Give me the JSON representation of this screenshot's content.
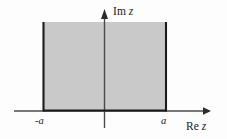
{
  "figure": {
    "background_color": "#fdfdfd",
    "region_fill_color": "#c9c9c9",
    "region_border_color": "#1a1a1a",
    "axis_color": "#4a4a4a",
    "text_color": "#1a1a1a",
    "axes": {
      "vertical": {
        "label_prefix": "Im",
        "label_variable": "z",
        "label_full": "Im z",
        "x_position": 104,
        "arrow_tip_y": 10,
        "base_y": 128
      },
      "horizontal": {
        "label_prefix": "Re",
        "label_variable": "z",
        "label_full": "Re z",
        "y_position": 111,
        "arrow_tip_x": 210,
        "start_x": 14
      }
    },
    "ticks": [
      {
        "name": "negative-a",
        "label_sign": "-",
        "label_variable": "a",
        "label_full": "-a",
        "x_position": 43,
        "value": "-a"
      },
      {
        "name": "positive-a",
        "label_sign": "",
        "label_variable": "a",
        "label_full": "a",
        "x_position": 166,
        "value": "a"
      }
    ],
    "region": {
      "name": "shaded-strip",
      "left_boundary_x": 43,
      "right_boundary_x": 166,
      "top_y": 22,
      "bottom_y": 111,
      "condition": "-a <= Re z <= a"
    }
  }
}
